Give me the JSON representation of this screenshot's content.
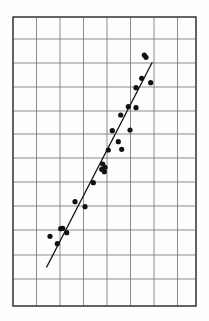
{
  "figure": {
    "title": "",
    "background_color": "#fdfdfd",
    "width": 209,
    "height": 321
  },
  "grid": {
    "label": "graph-paper-grid",
    "left": 13,
    "top": 17,
    "right": 196,
    "bottom": 306,
    "border_color": "#3a3a3a",
    "line_color": "#6e6e6e",
    "border_width": 1.4,
    "line_width": 0.8,
    "vertical_lines": [
      13,
      36.5,
      60,
      83.5,
      107,
      130.5,
      154,
      177.5,
      196
    ],
    "horizontal_lines": [
      17,
      39,
      63,
      87,
      111,
      134,
      158,
      182,
      206,
      230,
      255,
      279,
      306
    ],
    "columns": 8,
    "rows": 12
  },
  "chart_data": {
    "type": "scatter",
    "title": "",
    "xlabel": "",
    "ylabel": "",
    "grid": true,
    "legend": "none",
    "axis_tick_labels": {
      "x": [],
      "y": []
    },
    "xlim": [
      13,
      196
    ],
    "ylim": [
      306,
      17
    ],
    "marker": {
      "shape": "filled-circle",
      "color": "#111111",
      "radius": 2.6
    },
    "points": [
      {
        "x": 50.0,
        "y": 236.3
      },
      {
        "x": 57.3,
        "y": 243.7
      },
      {
        "x": 60.7,
        "y": 228.7
      },
      {
        "x": 66.7,
        "y": 232.7
      },
      {
        "x": 62.7,
        "y": 228.3
      },
      {
        "x": 75.0,
        "y": 201.7
      },
      {
        "x": 85.0,
        "y": 206.7
      },
      {
        "x": 93.3,
        "y": 182.7
      },
      {
        "x": 101.7,
        "y": 169.3
      },
      {
        "x": 105.0,
        "y": 167.3
      },
      {
        "x": 102.7,
        "y": 164.0
      },
      {
        "x": 104.3,
        "y": 171.7
      },
      {
        "x": 108.3,
        "y": 150.0
      },
      {
        "x": 121.7,
        "y": 149.3
      },
      {
        "x": 118.3,
        "y": 141.7
      },
      {
        "x": 112.3,
        "y": 130.7
      },
      {
        "x": 130.0,
        "y": 130.0
      },
      {
        "x": 120.7,
        "y": 115.0
      },
      {
        "x": 128.3,
        "y": 106.7
      },
      {
        "x": 136.0,
        "y": 107.7
      },
      {
        "x": 136.0,
        "y": 87.7
      },
      {
        "x": 150.7,
        "y": 82.7
      },
      {
        "x": 141.7,
        "y": 78.3
      },
      {
        "x": 146.0,
        "y": 57.3
      },
      {
        "x": 144.3,
        "y": 55.0
      }
    ],
    "fit_line": {
      "name": "least-squares-line",
      "color": "#111111",
      "width": 1.3,
      "x1": 46.7,
      "y1": 267.0,
      "x2": 152.0,
      "y2": 62.7
    }
  }
}
